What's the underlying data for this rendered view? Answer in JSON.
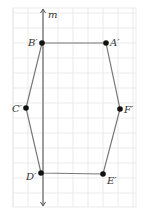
{
  "figure": {
    "width": 144,
    "height": 218,
    "grid": {
      "x0": 13,
      "y0": 8,
      "x1": 136,
      "y1": 207,
      "spacing": 15,
      "origin_x": 43,
      "origin_y": 43,
      "color": "#e6e6e6"
    },
    "line_m": {
      "label": "m",
      "x": 43,
      "y_top": 9,
      "y_bottom": 206,
      "color": "#555555"
    },
    "polygon_color": "#777777",
    "point_color": "#111111",
    "points": [
      {
        "name": "A'",
        "x": 106,
        "y": 43
      },
      {
        "name": "B'",
        "x": 42,
        "y": 43
      },
      {
        "name": "C'",
        "x": 26,
        "y": 108
      },
      {
        "name": "D'",
        "x": 41,
        "y": 173
      },
      {
        "name": "E'",
        "x": 103,
        "y": 174
      },
      {
        "name": "F'",
        "x": 120,
        "y": 109
      }
    ],
    "labels": {
      "m": "m",
      "A": "A′",
      "B": "B′",
      "C": "C′",
      "D": "D′",
      "E": "E′",
      "F": "F′"
    }
  }
}
